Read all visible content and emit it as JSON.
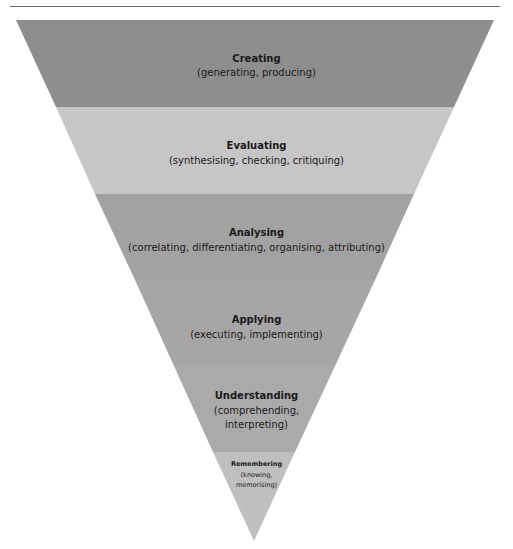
{
  "diagram": {
    "type": "inverted-pyramid",
    "levels": [
      {
        "name": "Creating",
        "detail": "(generating, producing)",
        "color": "#8e8e8e"
      },
      {
        "name": "Evaluating",
        "detail": "(synthesising, checking, critiquing)",
        "color": "#c6c6c6"
      },
      {
        "name": "Analysing",
        "detail": "(correlating, differentiating, organising, attributing)",
        "color": "#a2a2a2"
      },
      {
        "name": "Applying",
        "detail": "(executing, implementing)",
        "color": "#a6a6a6"
      },
      {
        "name": "Understanding",
        "detail_lines": [
          "(comprehending,",
          "interpreting)"
        ],
        "color": "#aaaaaa"
      },
      {
        "name": "Remembering",
        "detail_lines": [
          "(knowing,",
          "memorising)"
        ],
        "color": "#bfbfbf"
      }
    ]
  }
}
